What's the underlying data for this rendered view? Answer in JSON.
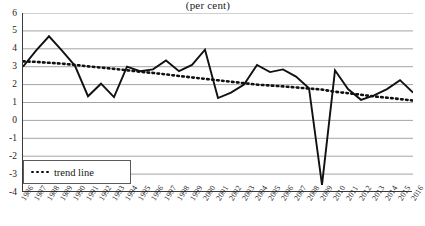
{
  "chart_data": {
    "type": "line",
    "title": "(per cent)",
    "xlabel": "",
    "ylabel": "",
    "ylim": [
      -4,
      6
    ],
    "yticks": [
      6,
      5,
      4,
      3,
      2,
      1,
      0,
      -1,
      -2,
      -3,
      -4
    ],
    "grid": true,
    "legend_position": "bottom-left",
    "categories": [
      "1986",
      "1987",
      "1988",
      "1989",
      "1990",
      "1991",
      "1992",
      "1993",
      "1994",
      "1995",
      "1996",
      "1997",
      "1998",
      "1999",
      "2000",
      "2001",
      "2002",
      "2003",
      "2004",
      "2005",
      "2006",
      "2007",
      "2008",
      "2009",
      "2010",
      "2011",
      "2012",
      "2013",
      "2014",
      "2015",
      "2016"
    ],
    "series": [
      {
        "name": "growth rate",
        "style": "solid",
        "color": "#111111",
        "values": [
          3.0,
          3.9,
          4.7,
          3.9,
          3.05,
          1.35,
          2.05,
          1.3,
          3.0,
          2.75,
          2.85,
          3.35,
          2.75,
          3.1,
          3.95,
          1.25,
          1.55,
          2.0,
          3.1,
          2.7,
          2.85,
          2.45,
          1.8,
          -3.6,
          2.8,
          1.75,
          1.15,
          1.4,
          1.75,
          2.25,
          1.55
        ]
      },
      {
        "name": "trend line",
        "style": "dotted",
        "color": "#111111",
        "values": [
          3.3,
          3.27,
          3.22,
          3.17,
          3.1,
          3.02,
          2.95,
          2.88,
          2.8,
          2.72,
          2.65,
          2.57,
          2.48,
          2.4,
          2.32,
          2.24,
          2.16,
          2.08,
          2.0,
          1.95,
          1.9,
          1.84,
          1.78,
          1.72,
          1.6,
          1.52,
          1.43,
          1.34,
          1.27,
          1.19,
          1.11
        ]
      }
    ],
    "legend": [
      {
        "label": "trend line",
        "marker": "dotted-line"
      }
    ]
  }
}
